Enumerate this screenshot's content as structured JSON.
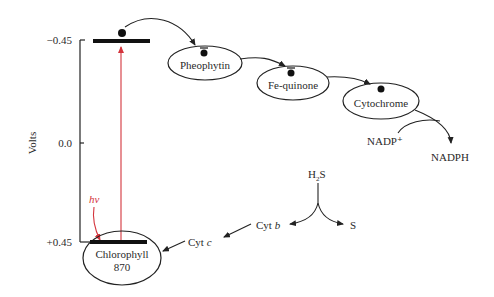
{
  "axis": {
    "title": "Volts",
    "ticks": [
      {
        "label": "−0.45"
      },
      {
        "label": "0.0"
      },
      {
        "label": "+0.45"
      }
    ]
  },
  "nodes": {
    "pheophytin": {
      "label": "Pheophytin"
    },
    "fe_quinone": {
      "label": "Fe-quinone"
    },
    "cytochrome": {
      "label": "Cytochrome"
    },
    "chlorophyll": {
      "label_line1": "Chlorophyll",
      "label_line2": "870"
    }
  },
  "labels": {
    "nadp_plus": "NADP⁺",
    "nadph": "NADPH",
    "h2s_h": "H",
    "h2s_sub": "2",
    "h2s_s": "S",
    "s": "S",
    "cyt_b_prefix": "Cyt ",
    "cyt_b_letter": "b",
    "cyt_c_prefix": "Cyt ",
    "cyt_c_letter": "c",
    "hv": "hν"
  },
  "colors": {
    "ink": "#222222",
    "light_arrow": "#d4343c"
  }
}
